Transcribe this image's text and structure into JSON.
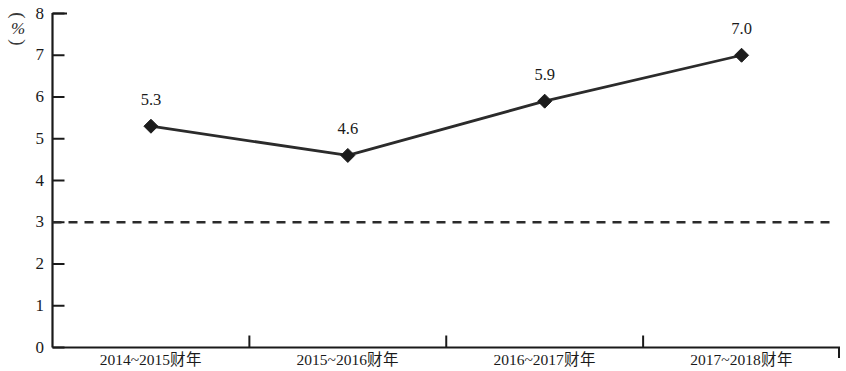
{
  "chart_data": {
    "type": "line",
    "title": "",
    "xlabel": "",
    "ylabel": "(%)",
    "ylabel_unit": "%",
    "ylim": [
      0,
      8
    ],
    "ytick_labels": [
      "0",
      "1",
      "2",
      "3",
      "4",
      "5",
      "6",
      "7",
      "8"
    ],
    "ytick_values": [
      0,
      1,
      2,
      3,
      4,
      5,
      6,
      7,
      8
    ],
    "grid": false,
    "legend": null,
    "categories": [
      "2014~2015财年",
      "2015~2016财年",
      "2016~2017财年",
      "2017~2018财年"
    ],
    "values": [
      5.3,
      4.6,
      5.9,
      7.0
    ],
    "point_labels": [
      "5.3",
      "4.6",
      "5.9",
      "7.0"
    ],
    "marker": "diamond",
    "reference_line": {
      "value": 3,
      "style": "dashed",
      "label": ""
    },
    "colors": {
      "line": "#2b2b2b",
      "marker": "#1c1c1c",
      "axis": "#1a1a1a",
      "reference_line": "#2b2b2b",
      "background": "#ffffff"
    }
  },
  "axes": {
    "y_unit_paren_open": "(",
    "y_unit_paren_close": ")",
    "y_unit_symbol": "%"
  }
}
